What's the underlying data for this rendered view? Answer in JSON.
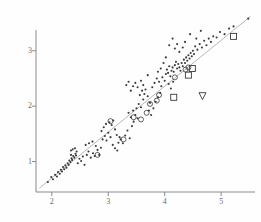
{
  "figure": {
    "background_color": "#fefefe",
    "ink_color": "#3a3a3a",
    "axis_color": "#8a8a8a",
    "label_color": "#6b6b6b",
    "line_color": "#9a9a9a"
  },
  "chart_data": {
    "type": "scatter",
    "title": "",
    "xlabel": "",
    "ylabel": "",
    "xlim": [
      1.72,
      5.6
    ],
    "ylim": [
      0.45,
      3.7
    ],
    "xticks": [
      2,
      3,
      4,
      5
    ],
    "yticks": [
      1,
      2,
      3
    ],
    "xtick_labels": [
      "2",
      "3",
      "4",
      "5"
    ],
    "ytick_labels": [
      "1",
      "2",
      "3"
    ],
    "grid": false,
    "legend": null,
    "reference_line": {
      "name": "identity-line",
      "x": [
        1.78,
        5.52
      ],
      "y": [
        0.52,
        3.62
      ]
    },
    "series": [
      {
        "name": "filled-dots",
        "marker": "filled-circle",
        "marker_size": 2.1,
        "points": [
          [
            1.93,
            0.63
          ],
          [
            1.99,
            0.72
          ],
          [
            2.02,
            0.68
          ],
          [
            2.06,
            0.76
          ],
          [
            2.09,
            0.73
          ],
          [
            2.11,
            0.81
          ],
          [
            2.14,
            0.78
          ],
          [
            2.16,
            0.85
          ],
          [
            2.18,
            0.82
          ],
          [
            2.2,
            0.9
          ],
          [
            2.22,
            0.86
          ],
          [
            2.24,
            0.93
          ],
          [
            2.26,
            0.89
          ],
          [
            2.28,
            0.97
          ],
          [
            2.3,
            0.94
          ],
          [
            2.31,
            1.02
          ],
          [
            2.33,
            0.99
          ],
          [
            2.35,
            1.06
          ],
          [
            2.36,
            1.03
          ],
          [
            2.38,
            1.1
          ],
          [
            2.34,
            1.12
          ],
          [
            2.4,
            1.07
          ],
          [
            2.42,
            1.14
          ],
          [
            2.43,
            1.11
          ],
          [
            2.44,
            1.18
          ],
          [
            2.46,
            0.97
          ],
          [
            2.49,
            1.05
          ],
          [
            2.52,
            1.01
          ],
          [
            2.55,
            1.09
          ],
          [
            2.58,
            0.94
          ],
          [
            2.34,
            1.2
          ],
          [
            2.37,
            1.22
          ],
          [
            2.41,
            1.24
          ],
          [
            2.62,
            1.12
          ],
          [
            2.65,
            1.18
          ],
          [
            2.69,
            1.07
          ],
          [
            2.73,
            1.15
          ],
          [
            2.76,
            1.1
          ],
          [
            2.6,
            1.3
          ],
          [
            2.66,
            1.33
          ],
          [
            2.72,
            1.36
          ],
          [
            2.78,
            1.28
          ],
          [
            2.81,
            1.21
          ],
          [
            2.84,
            1.12
          ],
          [
            2.87,
            1.25
          ],
          [
            2.9,
            1.4
          ],
          [
            2.94,
            1.46
          ],
          [
            2.97,
            1.38
          ],
          [
            3.0,
            1.52
          ],
          [
            3.04,
            1.44
          ],
          [
            2.88,
            1.55
          ],
          [
            2.92,
            1.62
          ],
          [
            2.96,
            1.68
          ],
          [
            3.02,
            1.71
          ],
          [
            3.06,
            1.66
          ],
          [
            3.09,
            1.74
          ],
          [
            3.12,
            1.58
          ],
          [
            3.15,
            1.48
          ],
          [
            3.18,
            1.34
          ],
          [
            3.22,
            1.4
          ],
          [
            3.26,
            1.33
          ],
          [
            3.08,
            1.3
          ],
          [
            3.12,
            1.24
          ],
          [
            3.16,
            1.2
          ],
          [
            3.2,
            1.44
          ],
          [
            3.3,
            1.47
          ],
          [
            3.34,
            1.56
          ],
          [
            3.38,
            1.42
          ],
          [
            3.42,
            1.64
          ],
          [
            3.45,
            1.72
          ],
          [
            3.4,
            1.8
          ],
          [
            3.36,
            1.88
          ],
          [
            3.44,
            1.92
          ],
          [
            3.48,
            1.84
          ],
          [
            3.52,
            1.78
          ],
          [
            3.5,
            1.96
          ],
          [
            3.54,
            2.04
          ],
          [
            3.58,
            1.98
          ],
          [
            3.62,
            2.12
          ],
          [
            3.56,
            2.2
          ],
          [
            3.6,
            2.28
          ],
          [
            3.64,
            2.22
          ],
          [
            3.52,
            2.34
          ],
          [
            3.48,
            2.42
          ],
          [
            3.44,
            2.36
          ],
          [
            3.4,
            2.28
          ],
          [
            3.36,
            2.44
          ],
          [
            3.32,
            2.38
          ],
          [
            3.58,
            2.46
          ],
          [
            3.62,
            2.38
          ],
          [
            3.66,
            2.3
          ],
          [
            3.7,
            2.18
          ],
          [
            3.74,
            2.06
          ],
          [
            3.72,
            1.92
          ],
          [
            3.76,
            1.84
          ],
          [
            3.8,
            1.96
          ],
          [
            3.84,
            2.08
          ],
          [
            3.88,
            2.16
          ],
          [
            3.92,
            2.24
          ],
          [
            3.78,
            2.34
          ],
          [
            3.82,
            2.42
          ],
          [
            3.86,
            2.5
          ],
          [
            3.9,
            2.44
          ],
          [
            3.94,
            2.36
          ],
          [
            3.96,
            2.52
          ],
          [
            4.0,
            2.46
          ],
          [
            4.02,
            2.58
          ],
          [
            4.04,
            2.66
          ],
          [
            4.06,
            2.6
          ],
          [
            4.08,
            2.72
          ],
          [
            4.1,
            2.54
          ],
          [
            4.12,
            2.64
          ],
          [
            4.14,
            2.7
          ],
          [
            4.16,
            2.62
          ],
          [
            4.18,
            2.74
          ],
          [
            4.07,
            2.4
          ],
          [
            4.11,
            2.32
          ],
          [
            4.15,
            2.44
          ],
          [
            4.2,
            2.8
          ],
          [
            4.22,
            2.68
          ],
          [
            4.24,
            2.76
          ],
          [
            4.26,
            2.7
          ],
          [
            4.28,
            2.64
          ],
          [
            4.3,
            2.78
          ],
          [
            4.32,
            2.72
          ],
          [
            4.34,
            2.84
          ],
          [
            4.36,
            2.78
          ],
          [
            4.38,
            2.88
          ],
          [
            4.4,
            2.82
          ],
          [
            4.42,
            2.92
          ],
          [
            4.44,
            2.86
          ],
          [
            4.46,
            2.96
          ],
          [
            4.48,
            2.9
          ],
          [
            4.5,
            3.0
          ],
          [
            4.52,
            2.94
          ],
          [
            4.18,
            3.04
          ],
          [
            4.22,
            3.12
          ],
          [
            4.26,
            2.98
          ],
          [
            4.32,
            3.06
          ],
          [
            4.36,
            3.16
          ],
          [
            4.14,
            3.22
          ],
          [
            4.08,
            3.1
          ],
          [
            4.02,
            2.88
          ],
          [
            3.98,
            2.78
          ],
          [
            3.93,
            2.68
          ],
          [
            4.54,
            3.08
          ],
          [
            4.58,
            3.02
          ],
          [
            4.62,
            3.12
          ],
          [
            4.66,
            3.06
          ],
          [
            4.7,
            3.18
          ],
          [
            4.74,
            3.1
          ],
          [
            4.78,
            3.22
          ],
          [
            4.82,
            3.16
          ],
          [
            4.86,
            3.26
          ],
          [
            4.92,
            3.24
          ],
          [
            4.98,
            3.34
          ],
          [
            5.06,
            3.3
          ],
          [
            5.14,
            3.4
          ],
          [
            5.22,
            3.44
          ],
          [
            5.48,
            3.58
          ],
          [
            4.45,
            3.3
          ],
          [
            4.56,
            3.22
          ],
          [
            4.64,
            3.36
          ],
          [
            3.88,
            2.62
          ],
          [
            3.7,
            2.56
          ]
        ]
      },
      {
        "name": "open-circles",
        "marker": "open-circle",
        "marker_size": 5.0,
        "points": [
          [
            2.81,
            1.12
          ],
          [
            3.04,
            1.73
          ],
          [
            3.27,
            1.4
          ],
          [
            3.45,
            1.8
          ],
          [
            3.68,
            1.88
          ],
          [
            3.74,
            2.04
          ],
          [
            3.86,
            2.1
          ],
          [
            3.9,
            2.2
          ],
          [
            4.18,
            2.52
          ],
          [
            4.37,
            2.66
          ],
          [
            4.42,
            2.7
          ],
          [
            3.58,
            1.76
          ]
        ]
      },
      {
        "name": "open-squares",
        "marker": "open-square",
        "marker_size": 6.0,
        "points": [
          [
            5.22,
            3.26
          ],
          [
            4.49,
            2.68
          ],
          [
            4.42,
            2.56
          ],
          [
            4.16,
            2.16
          ]
        ]
      },
      {
        "name": "open-triangle-down",
        "marker": "open-triangle-down",
        "marker_size": 7.0,
        "points": [
          [
            4.67,
            2.18
          ]
        ]
      }
    ]
  }
}
